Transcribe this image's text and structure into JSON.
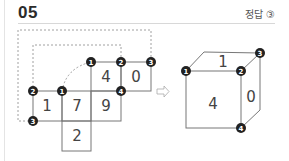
{
  "header": {
    "question_number": "05",
    "answer_label": "정답 ③"
  },
  "net": {
    "faces": [
      {
        "label": "4",
        "x": 106,
        "y": 77
      },
      {
        "label": "0",
        "x": 136,
        "y": 77
      },
      {
        "label": "1",
        "x": 47,
        "y": 106
      },
      {
        "label": "7",
        "x": 77,
        "y": 106
      },
      {
        "label": "9",
        "x": 106,
        "y": 106
      },
      {
        "label": "2",
        "x": 77,
        "y": 136
      }
    ],
    "vertices": [
      {
        "label": "1",
        "x": 91,
        "y": 62
      },
      {
        "label": "2",
        "x": 121,
        "y": 62
      },
      {
        "label": "3",
        "x": 151,
        "y": 62
      },
      {
        "label": "2",
        "x": 33,
        "y": 91
      },
      {
        "label": "1",
        "x": 62,
        "y": 91
      },
      {
        "label": "4",
        "x": 121,
        "y": 91
      },
      {
        "label": "3",
        "x": 33,
        "y": 121
      }
    ]
  },
  "arrow": {
    "symbol": "⇨"
  },
  "cube": {
    "faces": [
      {
        "label": "1",
        "x": 223,
        "y": 62
      },
      {
        "label": "4",
        "x": 213,
        "y": 104
      },
      {
        "label": "0",
        "x": 251,
        "y": 97
      }
    ],
    "vertices": [
      {
        "label": "1",
        "x": 186,
        "y": 71
      },
      {
        "label": "2",
        "x": 241,
        "y": 71
      },
      {
        "label": "3",
        "x": 260,
        "y": 53
      },
      {
        "label": "4",
        "x": 241,
        "y": 128
      }
    ]
  }
}
